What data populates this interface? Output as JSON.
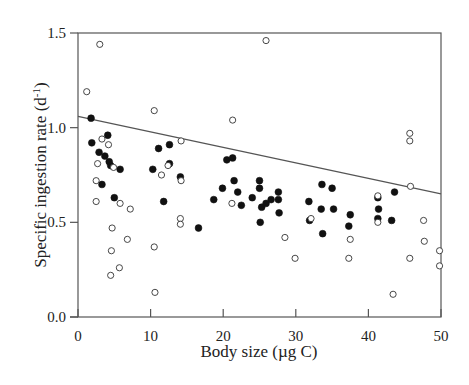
{
  "chart_data": {
    "type": "scatter",
    "title": "",
    "xlabel": "Body size (µg C)",
    "ylabel": "Specific ingestion rate (d",
    "ylabel_sup": "-1",
    "ylabel_end": ")",
    "xlim": [
      0,
      50
    ],
    "ylim": [
      0.0,
      1.5
    ],
    "x_ticks": [
      0,
      10,
      20,
      30,
      40,
      50
    ],
    "x_tick_labels": [
      "0",
      "10",
      "20",
      "30",
      "40",
      "50"
    ],
    "y_ticks": [
      0.0,
      0.5,
      1.0,
      1.5
    ],
    "y_tick_labels": [
      "0.0",
      "0.5",
      "1.0",
      "1.5"
    ],
    "grid": false,
    "legend": null,
    "regression_line": {
      "x": [
        0,
        50
      ],
      "y": [
        1.06,
        0.65
      ]
    },
    "series": [
      {
        "name": "filled",
        "marker": "filled-circle",
        "points": [
          [
            1.8,
            1.05
          ],
          [
            1.9,
            0.92
          ],
          [
            2.9,
            0.87
          ],
          [
            3.3,
            0.7
          ],
          [
            4.1,
            0.96
          ],
          [
            3.7,
            0.85
          ],
          [
            4.3,
            0.82
          ],
          [
            4.5,
            0.8
          ],
          [
            5.8,
            0.78
          ],
          [
            5.0,
            0.63
          ],
          [
            10.3,
            0.78
          ],
          [
            11.1,
            0.89
          ],
          [
            12.6,
            0.81
          ],
          [
            11.8,
            0.61
          ],
          [
            12.6,
            0.91
          ],
          [
            14.1,
            0.74
          ],
          [
            16.6,
            0.47
          ],
          [
            18.7,
            0.62
          ],
          [
            19.9,
            0.68
          ],
          [
            20.5,
            0.83
          ],
          [
            21.3,
            0.84
          ],
          [
            21.5,
            0.72
          ],
          [
            22.0,
            0.66
          ],
          [
            22.5,
            0.59
          ],
          [
            24.0,
            0.63
          ],
          [
            25.0,
            0.72
          ],
          [
            25.0,
            0.68
          ],
          [
            25.1,
            0.5
          ],
          [
            25.3,
            0.58
          ],
          [
            25.9,
            0.6
          ],
          [
            26.6,
            0.62
          ],
          [
            27.6,
            0.66
          ],
          [
            27.6,
            0.62
          ],
          [
            27.7,
            0.55
          ],
          [
            31.8,
            0.61
          ],
          [
            31.9,
            0.51
          ],
          [
            33.5,
            0.57
          ],
          [
            33.6,
            0.7
          ],
          [
            33.7,
            0.44
          ],
          [
            35.2,
            0.57
          ],
          [
            35.0,
            0.68
          ],
          [
            37.3,
            0.48
          ],
          [
            37.5,
            0.54
          ],
          [
            41.3,
            0.63
          ],
          [
            41.4,
            0.57
          ],
          [
            41.3,
            0.52
          ],
          [
            43.2,
            0.51
          ],
          [
            43.6,
            0.66
          ]
        ]
      },
      {
        "name": "open",
        "marker": "open-circle",
        "points": [
          [
            1.2,
            1.19
          ],
          [
            3.0,
            1.44
          ],
          [
            2.5,
            0.72
          ],
          [
            2.5,
            0.61
          ],
          [
            2.7,
            0.81
          ],
          [
            3.3,
            0.94
          ],
          [
            4.2,
            0.91
          ],
          [
            4.9,
            0.79
          ],
          [
            4.7,
            0.47
          ],
          [
            4.6,
            0.35
          ],
          [
            4.5,
            0.22
          ],
          [
            5.8,
            0.6
          ],
          [
            5.7,
            0.26
          ],
          [
            6.8,
            0.41
          ],
          [
            7.2,
            0.57
          ],
          [
            10.5,
            1.09
          ],
          [
            10.5,
            0.37
          ],
          [
            10.6,
            0.13
          ],
          [
            11.5,
            0.75
          ],
          [
            12.4,
            0.8
          ],
          [
            14.2,
            0.93
          ],
          [
            14.2,
            0.72
          ],
          [
            14.1,
            0.52
          ],
          [
            14.1,
            0.49
          ],
          [
            21.3,
            1.04
          ],
          [
            21.2,
            0.6
          ],
          [
            25.9,
            1.46
          ],
          [
            28.5,
            0.42
          ],
          [
            29.9,
            0.31
          ],
          [
            32.1,
            0.52
          ],
          [
            37.5,
            0.41
          ],
          [
            37.3,
            0.31
          ],
          [
            41.3,
            0.64
          ],
          [
            41.3,
            0.5
          ],
          [
            43.4,
            0.12
          ],
          [
            45.7,
            0.97
          ],
          [
            45.7,
            0.93
          ],
          [
            45.8,
            0.69
          ],
          [
            45.7,
            0.31
          ],
          [
            47.6,
            0.51
          ],
          [
            47.7,
            0.4
          ],
          [
            49.8,
            0.35
          ],
          [
            49.8,
            0.27
          ]
        ]
      }
    ]
  },
  "style": {
    "axis_color": "#555555",
    "marker_color": "#111111",
    "background": "#ffffff"
  }
}
